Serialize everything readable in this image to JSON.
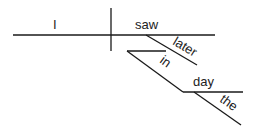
{
  "diagram": {
    "type": "sentence-diagram",
    "sentence_words": [
      "I",
      "saw",
      "later",
      "in",
      "day",
      "the"
    ],
    "subject": {
      "text": "I"
    },
    "verb": {
      "text": "saw"
    },
    "modifiers": {
      "adverb": {
        "text": "later"
      },
      "preposition": {
        "text": "in"
      },
      "prep_object": {
        "text": "day"
      },
      "article": {
        "text": "the"
      }
    },
    "colors": {
      "line": "#1a1a1a",
      "text": "#222222",
      "background": "#ffffff"
    }
  }
}
